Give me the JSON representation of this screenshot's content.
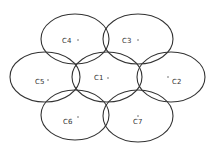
{
  "diagram": {
    "type": "cellular-cluster",
    "colors": {
      "stroke": "#333333",
      "background": "#ffffff",
      "text": "#333333"
    },
    "cells": [
      {
        "id": "C1",
        "label": "C1",
        "cx": 107,
        "cy": 77,
        "rx": 35,
        "ry": 25,
        "label_x": 94,
        "label_y": 80,
        "dot_x": 108,
        "dot_y": 78
      },
      {
        "id": "C2",
        "label": "C2",
        "cx": 171,
        "cy": 77,
        "rx": 34,
        "ry": 25,
        "label_x": 172,
        "label_y": 84,
        "dot_x": 168,
        "dot_y": 77
      },
      {
        "id": "C3",
        "label": "C3",
        "cx": 138,
        "cy": 39,
        "rx": 35,
        "ry": 25,
        "label_x": 122,
        "label_y": 43,
        "dot_x": 138,
        "dot_y": 40
      },
      {
        "id": "C4",
        "label": "C4",
        "cx": 75,
        "cy": 39,
        "rx": 34,
        "ry": 25,
        "label_x": 62,
        "label_y": 43,
        "dot_x": 78,
        "dot_y": 40
      },
      {
        "id": "C5",
        "label": "C5",
        "cx": 45,
        "cy": 77,
        "rx": 35,
        "ry": 25,
        "label_x": 35,
        "label_y": 84,
        "dot_x": 48,
        "dot_y": 80
      },
      {
        "id": "C6",
        "label": "C6",
        "cx": 75,
        "cy": 115,
        "rx": 34,
        "ry": 25,
        "label_x": 63,
        "label_y": 124,
        "dot_x": 78,
        "dot_y": 117
      },
      {
        "id": "C7",
        "label": "C7",
        "cx": 138,
        "cy": 116,
        "rx": 35,
        "ry": 26,
        "label_x": 133,
        "label_y": 124,
        "dot_x": 138,
        "dot_y": 116
      }
    ]
  }
}
